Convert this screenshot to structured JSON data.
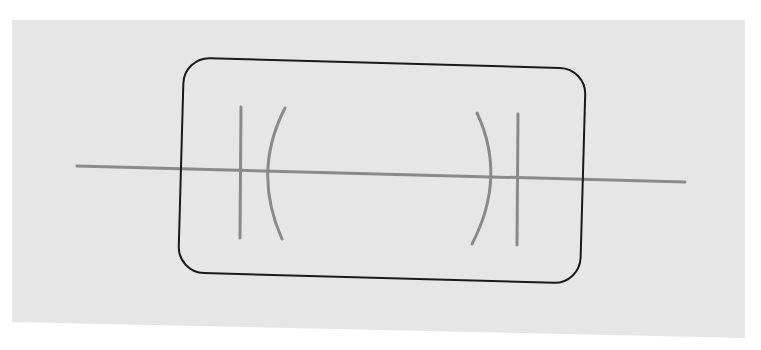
{
  "diagram": {
    "colors": {
      "page_background": "#ffffff",
      "paper": "#e6e6e6",
      "outline": "#1a1a1a",
      "wire": "#8a8a8a"
    },
    "paper": {
      "points": "12,20 745,20 745,338 12,322"
    },
    "package_outline": {
      "x": 181,
      "y": 63,
      "width": 402,
      "height": 215,
      "radius": 26,
      "stroke_width": 2
    },
    "lead_wire": {
      "x1": 77,
      "y1": 166,
      "x2": 685,
      "y2": 182,
      "stroke_width": 3
    },
    "capacitor_left": {
      "flat_plate": {
        "x1": 241,
        "y1": 107,
        "x2": 240,
        "y2": 238
      },
      "curved_plate": {
        "path": "M285,108 Q252,172 282,239"
      }
    },
    "capacitor_right": {
      "curved_plate": {
        "path": "M477,113 Q507,177 472,244"
      },
      "flat_plate": {
        "x1": 518,
        "y1": 114,
        "x2": 517,
        "y2": 245
      }
    },
    "labels": []
  }
}
